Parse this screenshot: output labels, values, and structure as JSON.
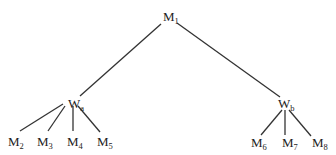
{
  "diagram": {
    "type": "tree",
    "nodes": [
      {
        "id": "M1",
        "base": "M",
        "sub": "1"
      },
      {
        "id": "Wa",
        "base": "W",
        "sub": "a"
      },
      {
        "id": "Wb",
        "base": "W",
        "sub": "b"
      },
      {
        "id": "M2",
        "base": "M",
        "sub": "2"
      },
      {
        "id": "M3",
        "base": "M",
        "sub": "3"
      },
      {
        "id": "M4",
        "base": "M",
        "sub": "4"
      },
      {
        "id": "M5",
        "base": "M",
        "sub": "5"
      },
      {
        "id": "M6",
        "base": "M",
        "sub": "6"
      },
      {
        "id": "M7",
        "base": "M",
        "sub": "7"
      },
      {
        "id": "M8",
        "base": "M",
        "sub": "8"
      }
    ],
    "edges": [
      {
        "from": "M1",
        "to": "Wa"
      },
      {
        "from": "M1",
        "to": "Wb"
      },
      {
        "from": "Wa",
        "to": "M2"
      },
      {
        "from": "Wa",
        "to": "M3"
      },
      {
        "from": "Wa",
        "to": "M4"
      },
      {
        "from": "Wa",
        "to": "M5"
      },
      {
        "from": "Wb",
        "to": "M6"
      },
      {
        "from": "Wb",
        "to": "M7"
      },
      {
        "from": "Wb",
        "to": "M8"
      }
    ]
  }
}
